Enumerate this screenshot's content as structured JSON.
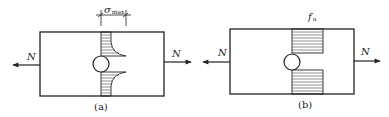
{
  "figure": {
    "panels": [
      {
        "id": "a",
        "caption": "(a)",
        "force_left_label": "N",
        "force_right_label": "N",
        "stress_label": "σ",
        "stress_subscript": "max",
        "description": "Elastic stress distribution with stress concentration at hole"
      },
      {
        "id": "b",
        "caption": "(b)",
        "force_left_label": "N",
        "force_right_label": "N",
        "stress_label": "f",
        "stress_subscript": "u",
        "description": "Plastic (uniform) stress distribution at ultimate strength"
      }
    ],
    "colors": {
      "line": "#222222",
      "hatch": "#444444",
      "background": "#ffffff"
    }
  }
}
